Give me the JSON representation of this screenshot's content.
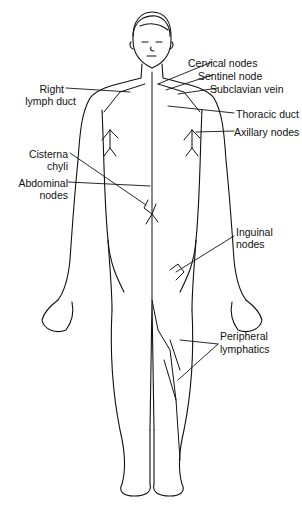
{
  "diagram": {
    "labels": {
      "cervical_nodes": "Cervical nodes",
      "sentinel_node": "Sentinel node",
      "subclavian_vein": "Subclavian vein",
      "right_lymph_duct_1": "Right",
      "right_lymph_duct_2": "lymph duct",
      "thoracic_duct": "Thoracic duct",
      "axillary_nodes": "Axillary nodes",
      "cisterna_chyli_1": "Cisterna",
      "cisterna_chyli_2": "chyli",
      "abdominal_nodes_1": "Abdominal",
      "abdominal_nodes_2": "nodes",
      "inguinal_nodes_1": "Inguinal",
      "inguinal_nodes_2": "nodes",
      "peripheral_lymphatics_1": "Peripheral",
      "peripheral_lymphatics_2": "lymphatics"
    },
    "colors": {
      "line": "#111111",
      "background": "#ffffff"
    }
  }
}
